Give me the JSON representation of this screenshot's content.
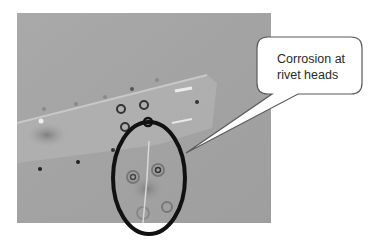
{
  "figure": {
    "callout": {
      "line1": "Corrosion at",
      "line2": "rivet heads"
    },
    "colors": {
      "photo_background": "#a6a6a6",
      "ellipse_stroke": "#111111",
      "callout_border": "#555555",
      "callout_fill": "#ffffff"
    }
  }
}
